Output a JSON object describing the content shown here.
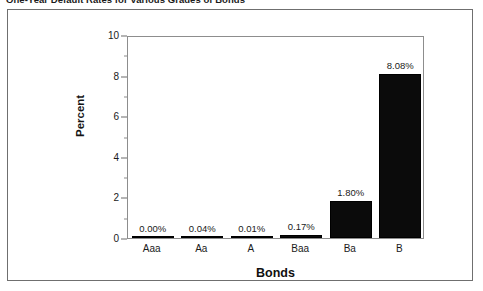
{
  "caption": {
    "text": "One-Year Default Rates for Various Grades of Bonds"
  },
  "chart_data": {
    "type": "bar",
    "title": "One-Year Default Rates for Various Grades of Bonds",
    "xlabel": "Bonds",
    "ylabel": "Percent",
    "categories": [
      "Aaa",
      "Aa",
      "A",
      "Baa",
      "Ba",
      "B"
    ],
    "values": [
      0.0,
      0.04,
      0.01,
      0.17,
      1.8,
      8.08
    ],
    "data_labels": [
      "0.00%",
      "0.04%",
      "0.01%",
      "0.17%",
      "1.80%",
      "8.08%"
    ],
    "ylim": [
      0,
      10
    ],
    "y_major_ticks": [
      0,
      2,
      4,
      6,
      8,
      10
    ],
    "y_tick_labels": [
      "0",
      "2",
      "4",
      "6",
      "8",
      "10"
    ],
    "y_minor_ticks": [
      1,
      3,
      5,
      7,
      9
    ],
    "grid": false,
    "legend": null,
    "bar_color": "#0b0b0b",
    "axis_color": "#8d8d8d",
    "frame_color": "#6f6f6f"
  }
}
